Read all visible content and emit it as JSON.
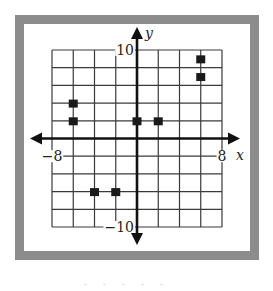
{
  "chart_data": {
    "type": "scatter",
    "title": "",
    "xlabel": "x",
    "ylabel": "y",
    "xlim": [
      -8,
      8
    ],
    "ylim": [
      -10,
      10
    ],
    "x_grid_step": 2,
    "y_grid_step": 2,
    "grid": true,
    "x_tick_labels": [
      {
        "value": -8,
        "label": "−8"
      },
      {
        "value": 8,
        "label": "8"
      }
    ],
    "y_tick_labels": [
      {
        "value": 10,
        "label": "10"
      },
      {
        "value": -10,
        "label": "−10"
      }
    ],
    "series": [
      {
        "name": "points",
        "marker": "square",
        "color": "#1a1a1a",
        "points": [
          {
            "x": -6,
            "y": 4
          },
          {
            "x": -6,
            "y": 2
          },
          {
            "x": 0,
            "y": 2
          },
          {
            "x": 2,
            "y": 2
          },
          {
            "x": 6,
            "y": 9
          },
          {
            "x": 6,
            "y": 7
          },
          {
            "x": -4,
            "y": -6
          },
          {
            "x": -2,
            "y": -6
          }
        ]
      }
    ],
    "legend": "none"
  },
  "colors": {
    "frame": "#8c8c8c",
    "ink": "#1a1a1a"
  }
}
